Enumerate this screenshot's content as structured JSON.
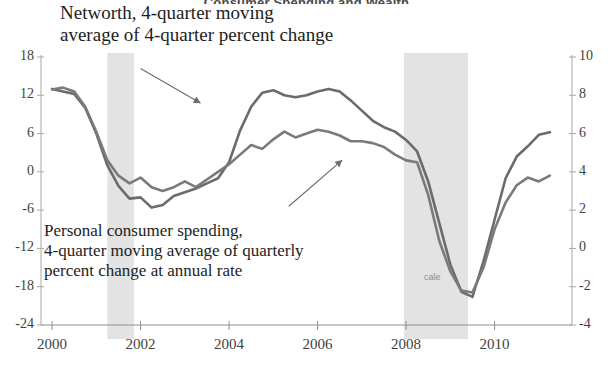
{
  "chart_data": {
    "type": "line",
    "title": "Consumer Spending and Wealth",
    "xlabel": "",
    "ylabel_left": "",
    "ylabel_right": "",
    "grid": false,
    "legend_position": "inline-annotations",
    "xlim": [
      1999.75,
      2011.75
    ],
    "ylim_left": [
      -24,
      18
    ],
    "ylim_right": [
      -4,
      10
    ],
    "y_ticks_left": [
      18,
      12,
      6,
      0,
      -6,
      -12,
      -18,
      -24
    ],
    "y_ticks_right": [
      10,
      8,
      6,
      4,
      2,
      0,
      -2,
      -4
    ],
    "x_ticks": [
      2000,
      2002,
      2004,
      2006,
      2008,
      2010
    ],
    "x_tick_labels": [
      "2000",
      "2002",
      "2004",
      "2006",
      "2008",
      "2010"
    ],
    "annotations": [
      {
        "id": "networth-label",
        "text": "Networth, 4-quarter moving\naverage of 4-quarter percent change",
        "series": "networth",
        "arrow_from": [
          2002.0,
          16.2
        ],
        "arrow_to": [
          2003.35,
          10.8
        ]
      },
      {
        "id": "spending-label",
        "text": "Personal consumer spending,\n4-quarter moving average of quarterly\npercent change at annual rate",
        "series": "spending",
        "arrow_from": [
          2005.35,
          -5.4
        ],
        "arrow_to": [
          2006.55,
          4.6
        ]
      },
      {
        "id": "scale-note",
        "text": "cale"
      }
    ],
    "shaded_regions": [
      {
        "label": "recession",
        "x0": 2001.25,
        "x1": 2001.85,
        "color": "#e3e3e3"
      },
      {
        "label": "recession",
        "x0": 2007.95,
        "x1": 2009.4,
        "color": "#e3e3e3"
      }
    ],
    "series": [
      {
        "name": "Networth, 4-quarter moving average of 4-quarter percent change",
        "axis": "left",
        "color": "#6b6b6b",
        "x": [
          2000.0,
          2000.25,
          2000.5,
          2000.75,
          2001.0,
          2001.25,
          2001.5,
          2001.75,
          2002.0,
          2002.25,
          2002.5,
          2002.75,
          2003.0,
          2003.25,
          2003.5,
          2003.75,
          2004.0,
          2004.25,
          2004.5,
          2004.75,
          2005.0,
          2005.25,
          2005.5,
          2005.75,
          2006.0,
          2006.25,
          2006.5,
          2006.75,
          2007.0,
          2007.25,
          2007.5,
          2007.75,
          2008.0,
          2008.25,
          2008.5,
          2008.75,
          2009.0,
          2009.25,
          2009.5,
          2009.75,
          2010.0,
          2010.25,
          2010.5,
          2010.75,
          2011.0,
          2011.25
        ],
        "values": [
          13.0,
          12.6,
          12.2,
          10.0,
          6.0,
          1.0,
          -2.2,
          -4.2,
          -4.0,
          -5.6,
          -5.2,
          -3.8,
          -3.2,
          -2.6,
          -1.8,
          -1.0,
          1.5,
          6.5,
          10.2,
          12.4,
          12.8,
          12.0,
          11.7,
          12.0,
          12.6,
          13.0,
          12.6,
          11.2,
          9.6,
          8.0,
          7.0,
          6.3,
          5.0,
          3.2,
          -1.5,
          -8.0,
          -14.5,
          -18.8,
          -19.6,
          -14.0,
          -7.5,
          -1.0,
          2.4,
          4.0,
          5.8,
          6.2
        ]
      },
      {
        "name": "Personal consumer spending, 4-quarter moving average of quarterly percent change at annual rate",
        "axis": "right",
        "color": "#7a7a7a",
        "x": [
          2000.0,
          2000.25,
          2000.5,
          2000.75,
          2001.0,
          2001.25,
          2001.5,
          2001.75,
          2002.0,
          2002.25,
          2002.5,
          2002.75,
          2003.0,
          2003.25,
          2003.5,
          2003.75,
          2004.0,
          2004.25,
          2004.5,
          2004.75,
          2005.0,
          2005.25,
          2005.5,
          2005.75,
          2006.0,
          2006.25,
          2006.5,
          2006.75,
          2007.0,
          2007.25,
          2007.5,
          2007.75,
          2008.0,
          2008.25,
          2008.5,
          2008.75,
          2009.0,
          2009.25,
          2009.5,
          2009.75,
          2010.0,
          2010.25,
          2010.5,
          2010.75,
          2011.0,
          2011.25
        ],
        "values": [
          8.3,
          8.4,
          8.2,
          7.4,
          6.1,
          4.6,
          3.8,
          3.4,
          3.7,
          3.2,
          3.0,
          3.2,
          3.5,
          3.2,
          3.6,
          4.0,
          4.4,
          4.9,
          5.4,
          5.2,
          5.7,
          6.1,
          5.8,
          6.0,
          6.2,
          6.1,
          5.9,
          5.6,
          5.6,
          5.5,
          5.3,
          4.9,
          4.6,
          4.5,
          2.8,
          0.4,
          -1.2,
          -2.2,
          -2.3,
          -1.0,
          1.0,
          2.4,
          3.3,
          3.7,
          3.5,
          3.8
        ]
      }
    ]
  },
  "title_text": "Consumer Spending and Wealth",
  "annotation_networth_line1": "Networth, 4-quarter moving",
  "annotation_networth_line2": "average of 4-quarter percent change",
  "annotation_spending_line1": "Personal consumer spending,",
  "annotation_spending_line2": "4-quarter moving average of quarterly",
  "annotation_spending_line3": "percent change at annual rate",
  "scale_note": "cale",
  "axis": {
    "left_ticks": [
      "18",
      "12",
      "6",
      "0",
      "-6",
      "-12",
      "-18",
      "-24"
    ],
    "right_ticks": [
      "10",
      "8",
      "6",
      "4",
      "2",
      "0",
      "-2",
      "-4"
    ],
    "x_ticks": [
      "2000",
      "2002",
      "2004",
      "2006",
      "2008",
      "2010"
    ]
  }
}
